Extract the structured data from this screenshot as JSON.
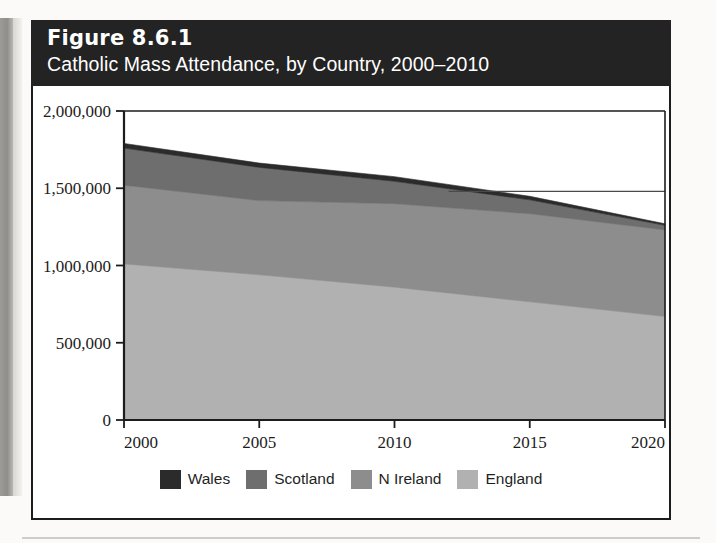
{
  "figure": {
    "number": "Figure 8.6.1",
    "title": "Catholic Mass Attendance, by Country, 2000–2010"
  },
  "colors": {
    "wales": "#2b2b2b",
    "scotland": "#6e6e6e",
    "n_ireland": "#8d8d8d",
    "england": "#b1b1b1",
    "axis": "#1c1c1c",
    "title_band": "#232323",
    "title_text": "#ffffff",
    "plot_background": "#ffffff"
  },
  "legend": {
    "position": "bottom",
    "items": [
      {
        "label": "Wales",
        "color": "#2b2b2b"
      },
      {
        "label": "Scotland",
        "color": "#6e6e6e"
      },
      {
        "label": "N Ireland",
        "color": "#8d8d8d"
      },
      {
        "label": "England",
        "color": "#b1b1b1"
      }
    ]
  },
  "chart_data": {
    "type": "area",
    "stacked": true,
    "title": "Catholic Mass Attendance, by Country, 2000–2010",
    "xlabel": "",
    "ylabel": "",
    "xlim": [
      2000,
      2020
    ],
    "ylim": [
      0,
      2000000
    ],
    "grid": false,
    "x": [
      2000,
      2005,
      2010,
      2015,
      2020
    ],
    "xticks": [
      "2000",
      "2005",
      "2010",
      "2015",
      "2020"
    ],
    "yticks": [
      "0",
      "500,000",
      "1,000,000",
      "1,500,000",
      "2,000,000"
    ],
    "ytick_values": [
      0,
      500000,
      1000000,
      1500000,
      2000000
    ],
    "series": [
      {
        "name": "England",
        "color": "#b1b1b1",
        "values": [
          1010000,
          940000,
          860000,
          765000,
          670000
        ]
      },
      {
        "name": "N Ireland",
        "color": "#8d8d8d",
        "values": [
          510000,
          480000,
          540000,
          570000,
          560000
        ]
      },
      {
        "name": "Scotland",
        "color": "#6e6e6e",
        "values": [
          240000,
          215000,
          145000,
          90000,
          30000
        ]
      },
      {
        "name": "Wales",
        "color": "#2b2b2b",
        "values": [
          30000,
          28000,
          30000,
          23000,
          10000
        ]
      }
    ],
    "cumulative_totals": [
      1790000,
      1663000,
      1575000,
      1448000,
      1270000
    ],
    "annotations": [
      {
        "type": "horizontal-reference-line",
        "value": 1480000,
        "x_start": 2012,
        "x_end": 2020
      }
    ]
  }
}
